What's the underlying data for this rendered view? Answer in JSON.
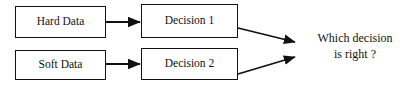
{
  "diagram": {
    "background_color": "#ffffff",
    "stroke_color": "#111111",
    "nodes": [
      {
        "id": "hard-data",
        "label": "Hard Data",
        "x": 15,
        "y": 6,
        "w": 91,
        "h": 32
      },
      {
        "id": "soft-data",
        "label": "Soft Data",
        "x": 15,
        "y": 50,
        "w": 91,
        "h": 30
      },
      {
        "id": "decision-1",
        "label": "Decision 1",
        "x": 141,
        "y": 4,
        "w": 97,
        "h": 34
      },
      {
        "id": "decision-2",
        "label": "Decision 2",
        "x": 141,
        "y": 48,
        "w": 97,
        "h": 32
      }
    ],
    "edges": [
      {
        "id": "hard-to-decision-1",
        "from": "hard-data",
        "to": "decision-1",
        "style": "straight-arrow"
      },
      {
        "id": "soft-to-decision-2",
        "from": "soft-data",
        "to": "decision-2",
        "style": "straight-arrow"
      },
      {
        "id": "decision-1-to-question",
        "from": "decision-1",
        "to": "question",
        "style": "diagonal-arrow"
      },
      {
        "id": "decision-2-to-question",
        "from": "decision-2",
        "to": "question",
        "style": "diagonal-arrow"
      }
    ],
    "question": {
      "line1": "Which decision",
      "line2": "is right ?"
    }
  }
}
